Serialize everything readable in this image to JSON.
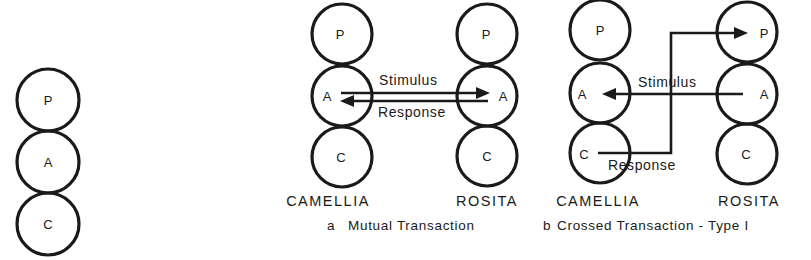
{
  "figure": {
    "ego_state_labels": [
      "P",
      "A",
      "C"
    ],
    "standalone": {
      "states": [
        "P",
        "A",
        "C"
      ]
    },
    "panel_a": {
      "left_person": "CAMELLIA",
      "right_person": "ROSITA",
      "stimulus_label": "Stimulus",
      "response_label": "Response",
      "caption_letter": "a",
      "caption_text": "Mutual Transaction",
      "stimulus": {
        "from": "CAMELLIA.A",
        "to": "ROSITA.A"
      },
      "response": {
        "from": "ROSITA.A",
        "to": "CAMELLIA.A"
      }
    },
    "panel_b": {
      "left_person": "CAMELLIA",
      "right_person": "ROSITA",
      "stimulus_label": "Stimulus",
      "response_label": "Response",
      "caption_letter": "b",
      "caption_text": "Crossed Transaction - Type I",
      "stimulus": {
        "from": "ROSITA.A",
        "to": "CAMELLIA.A"
      },
      "response": {
        "from": "CAMELLIA.C",
        "to": "ROSITA.P"
      }
    }
  }
}
